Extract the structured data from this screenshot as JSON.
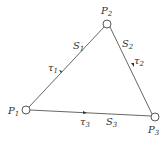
{
  "diagram": {
    "nodes": [
      {
        "id": "P1",
        "label": "P",
        "sub": "1",
        "x": 26,
        "y": 110
      },
      {
        "id": "P2",
        "label": "P",
        "sub": "2",
        "x": 107,
        "y": 24
      },
      {
        "id": "P3",
        "label": "P",
        "sub": "3",
        "x": 155,
        "y": 117
      }
    ],
    "edges": [
      {
        "id": "S1",
        "from": "P2",
        "to": "P1",
        "label": "S",
        "sub": "1",
        "tau": "τ",
        "tau_sub": "1"
      },
      {
        "id": "S2",
        "from": "P2",
        "to": "P3",
        "label": "S",
        "sub": "2",
        "tau": "τ",
        "tau_sub": "2"
      },
      {
        "id": "S3",
        "from": "P1",
        "to": "P3",
        "label": "S",
        "sub": "3",
        "tau": "τ",
        "tau_sub": "3"
      }
    ],
    "colors": {
      "line": "#555555",
      "text": "#333333",
      "bg": "#ffffff"
    }
  }
}
